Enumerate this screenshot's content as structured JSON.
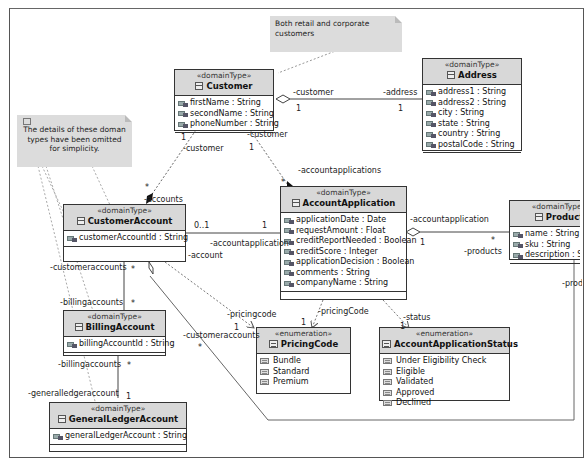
{
  "notes": [
    {
      "id": "note-customers",
      "text": "Both retail and corporate customers"
    },
    {
      "id": "note-omitted",
      "text": "The details of these doman types have been omitted for simplicity."
    }
  ],
  "classes": {
    "customer": {
      "stereotype": "«domainType»",
      "name": "Customer",
      "icon": "class-icon",
      "attributes": [
        "firstName : String",
        "secondName : String",
        "phoneNumber : String"
      ]
    },
    "address": {
      "stereotype": "«domainType»",
      "name": "Address",
      "icon": "class-icon",
      "attributes": [
        "address1 : String",
        "address2 : String",
        "city : String",
        "state : String",
        "country : String",
        "postalCode : String"
      ]
    },
    "customerAccount": {
      "stereotype": "«domainType»",
      "name": "CustomerAccount",
      "icon": "class-icon",
      "attributes": [
        "customerAccountId : String"
      ]
    },
    "accountApplication": {
      "stereotype": "«domainType»",
      "name": "AccountApplication",
      "icon": "class-icon",
      "attributes": [
        "applicationDate : Date",
        "requestAmount : Float",
        "creditReportNeeded : Boolean",
        "creditScore : Integer",
        "applicationDecision : Boolean",
        "comments : String",
        "companyName : String"
      ]
    },
    "product": {
      "stereotype": "«domainType»",
      "name": "Product",
      "icon": "class-icon",
      "attributes": [
        "name : String",
        "sku : String",
        "description : String"
      ]
    },
    "billingAccount": {
      "stereotype": "«domainType»",
      "name": "BillingAccount",
      "icon": "class-icon",
      "attributes": [
        "billingAccountId : String"
      ]
    },
    "generalLedgerAccount": {
      "stereotype": "«domainType»",
      "name": "GeneralLedgerAccount",
      "icon": "class-icon",
      "attributes": [
        "generalLedgerAccount : String"
      ]
    },
    "pricingCode": {
      "stereotype": "«enumeration»",
      "name": "PricingCode",
      "icon": "enumeration-icon",
      "literals": [
        "Bundle",
        "Standard",
        "Premium"
      ]
    },
    "accountApplicationStatus": {
      "stereotype": "«enumeration»",
      "name": "AccountApplicationStatus",
      "icon": "enumeration-icon",
      "literals": [
        "Under Eligibility Check",
        "Eligible",
        "Validated",
        "Approved",
        "Declined"
      ]
    }
  },
  "associations": {
    "customer_address": {
      "role_a": "-customer",
      "mult_a": "1",
      "role_b": "-address",
      "mult_b": "1",
      "kind": "aggregation"
    },
    "customer_customerAccount": {
      "role_a": "-customer",
      "mult_a": "1",
      "role_b": "-accounts",
      "mult_b": "*",
      "kind": "composition"
    },
    "customer_accountApplication": {
      "role_a": "-customer",
      "mult_a": "1",
      "role_b": "-accountapplications",
      "mult_b": "*",
      "kind": "composition"
    },
    "customerAccount_accountApplication": {
      "role_a": "-account",
      "mult_a": "0..1",
      "role_b": "-accountapplication",
      "mult_b": "1",
      "kind": "association"
    },
    "accountApplication_product": {
      "role_a": "-accountapplication",
      "mult_a": "1",
      "role_b": "-products",
      "mult_b": "*",
      "kind": "aggregation"
    },
    "customerAccount_billingAccount": {
      "role_a": "-customeraccounts",
      "mult_a": "*",
      "role_b": "-billingaccounts",
      "mult_b": "*",
      "kind": "association"
    },
    "billingAccount_generalLedger": {
      "role_a": "-billingaccounts",
      "mult_a": "*",
      "role_b": "-generalledgeraccount",
      "mult_b": "1",
      "kind": "association"
    },
    "customerAccount_pricingCode": {
      "role_b": "-pricingcode",
      "mult_b": "1",
      "kind": "dependency"
    },
    "accountApplication_pricingCode": {
      "role_b": "-pricingCode",
      "mult_b": "1",
      "kind": "dependency"
    },
    "accountApplication_status": {
      "role_b": "-status",
      "mult_b": "1",
      "kind": "dependency"
    },
    "customerAccount_product": {
      "role_a": "-customeraccounts",
      "mult_a": "*",
      "role_b": "-products",
      "kind": "aggregation"
    }
  }
}
